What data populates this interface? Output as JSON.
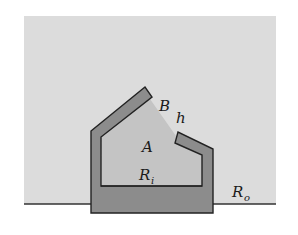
{
  "diagram": {
    "type": "enclosure-region-schematic",
    "colors": {
      "background": "#ffffff",
      "outer_region": "#dcdcdc",
      "inner_region": "#c4c4c4",
      "wall_fill": "#8c8c8c",
      "stroke": "#222222"
    },
    "labels": {
      "B": "B",
      "h": "h",
      "A": "A",
      "Ri_main": "R",
      "Ri_sub": "i",
      "Ro_main": "R",
      "Ro_sub": "o"
    }
  }
}
